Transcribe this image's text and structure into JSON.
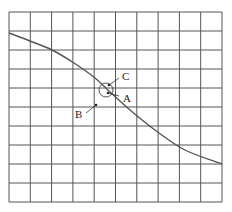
{
  "diagram": {
    "grid": {
      "x0": 9,
      "y0": 12,
      "x1": 222,
      "y1": 202,
      "cols": 10,
      "rows": 10,
      "line_color": "#555555"
    },
    "curve": {
      "description": "decreasing S-shaped curve across grid",
      "points": [
        [
          9,
          33
        ],
        [
          30,
          41
        ],
        [
          52,
          50
        ],
        [
          74,
          63
        ],
        [
          95,
          78
        ],
        [
          110,
          92
        ],
        [
          130,
          110
        ],
        [
          155,
          130
        ],
        [
          185,
          150
        ],
        [
          222,
          164
        ]
      ]
    },
    "circle": {
      "cx": 106,
      "cy": 90,
      "r": 7
    },
    "points": [
      {
        "id": "A",
        "label": "A",
        "x": 108,
        "y": 93,
        "label_x": 123,
        "label_y": 102,
        "leader_end": [
          119,
          96
        ]
      },
      {
        "id": "C",
        "label": "C",
        "x": 109,
        "y": 85,
        "label_x": 122,
        "label_y": 80,
        "leader_end": [
          119,
          78
        ]
      },
      {
        "id": "B",
        "label": "B",
        "x": 96,
        "y": 105,
        "label_x": 75,
        "label_y": 118,
        "leader_end": [
          86,
          113
        ]
      }
    ]
  }
}
